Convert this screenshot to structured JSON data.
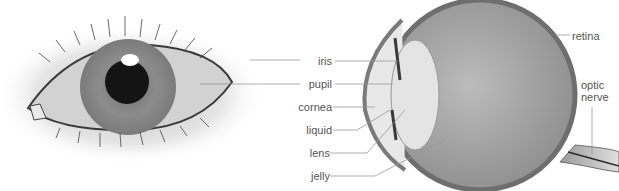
{
  "diagram": {
    "labels": {
      "iris": "iris",
      "pupil": "pupil",
      "cornea": "cornea",
      "liquid": "liquid",
      "lens": "lens",
      "jelly": "jelly",
      "retina": "retina",
      "optic_nerve_line1": "optic",
      "optic_nerve_line2": "nerve"
    },
    "colors": {
      "label_text": "#555555",
      "leader_line": "#999999",
      "eyeball_fill": "#9a9a9a",
      "sclera_outline": "#6e6e6e"
    }
  }
}
